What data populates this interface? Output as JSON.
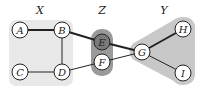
{
  "diagram": {
    "type": "graph",
    "regions": [
      {
        "id": "X",
        "label": "X",
        "label_pos": [
          40,
          14
        ],
        "color": "#e8e8e8",
        "shape": "rounded-rect",
        "nodes": [
          "A",
          "B",
          "C",
          "D"
        ]
      },
      {
        "id": "Z",
        "label": "Z",
        "label_pos": [
          102,
          14
        ],
        "color": "#9a9a9a",
        "shape": "rounded-rect",
        "nodes": [
          "E",
          "F"
        ]
      },
      {
        "id": "Y",
        "label": "Y",
        "label_pos": [
          164,
          14
        ],
        "color": "#c8c8c8",
        "shape": "hull",
        "nodes": [
          "G",
          "H",
          "I"
        ]
      }
    ],
    "nodes": [
      {
        "id": "A",
        "label": "A",
        "x": 20,
        "y": 30,
        "fill": "#ffffff"
      },
      {
        "id": "B",
        "label": "B",
        "x": 62,
        "y": 30,
        "fill": "#ffffff"
      },
      {
        "id": "C",
        "label": "C",
        "x": 20,
        "y": 72,
        "fill": "#ffffff"
      },
      {
        "id": "D",
        "label": "D",
        "x": 62,
        "y": 72,
        "fill": "#ffffff"
      },
      {
        "id": "E",
        "label": "E",
        "x": 102,
        "y": 42,
        "fill": "#7a7a7a"
      },
      {
        "id": "F",
        "label": "F",
        "x": 102,
        "y": 62,
        "fill": "#ffffff"
      },
      {
        "id": "G",
        "label": "G",
        "x": 142,
        "y": 52,
        "fill": "#ffffff"
      },
      {
        "id": "H",
        "label": "H",
        "x": 183,
        "y": 29,
        "fill": "#ffffff"
      },
      {
        "id": "I",
        "label": "I",
        "x": 183,
        "y": 73,
        "fill": "#ffffff"
      }
    ],
    "edges": [
      {
        "from": "A",
        "to": "B",
        "weight": "heavy"
      },
      {
        "from": "B",
        "to": "D",
        "weight": "light"
      },
      {
        "from": "C",
        "to": "D",
        "weight": "light"
      },
      {
        "from": "B",
        "to": "E",
        "weight": "heavy"
      },
      {
        "from": "D",
        "to": "F",
        "weight": "light"
      },
      {
        "from": "E",
        "to": "G",
        "weight": "heavy"
      },
      {
        "from": "F",
        "to": "G",
        "weight": "light"
      },
      {
        "from": "G",
        "to": "H",
        "weight": "heavy"
      },
      {
        "from": "G",
        "to": "I",
        "weight": "light"
      }
    ]
  }
}
